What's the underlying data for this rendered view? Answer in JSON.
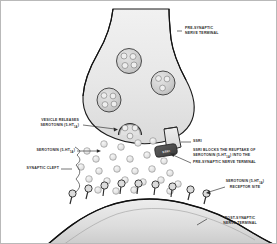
{
  "figure": {
    "background_color": "#ffffff",
    "border_color": "#b9b9b9",
    "outline_color": "#1a1a1a",
    "cell_fill": "#e8e8e8",
    "vesicle_fill": "#cfcfcf",
    "serotonin_fill": "#e3e3e3",
    "ssri_chip_fill": "#4a4a4a",
    "label_color": "#2b2b2b"
  },
  "labels": {
    "pre_synaptic": {
      "line1": "PRE-SYNAPTIC",
      "line2": "NERVE TERMINAL"
    },
    "vesicle_releases": {
      "line1": "VESICLE RELEASES",
      "line2_pre": "SEROTONIN (5-HT",
      "line2_sub": "1A",
      "line2_post": ")"
    },
    "serotonin": {
      "pre": "SEROTONIN (5-HT",
      "sub": "1A",
      "post": ")"
    },
    "synaptic_cleft": {
      "text": "SYNAPTIC CLEFT"
    },
    "ssri_caption": {
      "title": "SSRI",
      "line1": "SSRI BLOCKS THE REUPTAKE OF",
      "line2_pre": "SEROTONIN (5-HT",
      "line2_sub": "1A",
      "line2_post": ") INTO THE",
      "line3": "PRE-SYNAPTIC NERVE TERMINAL"
    },
    "ssri_chip": {
      "text": "SSRI"
    },
    "receptor_site": {
      "line1_pre": "SEROTONIN (5-HT",
      "line1_sub": "1A",
      "line1_post": ")",
      "line2": "RECEPTOR SITE"
    },
    "post_synaptic": {
      "line1": "POST-SYNAPTIC",
      "line2": "NERVE TERMINAL"
    }
  },
  "diagram_elements": {
    "vesicles_in_terminal": 3,
    "fusing_vesicle": 1,
    "serotonin_molecules_in_cleft": 26,
    "receptor_sites": 9,
    "transporter_count": 1
  }
}
